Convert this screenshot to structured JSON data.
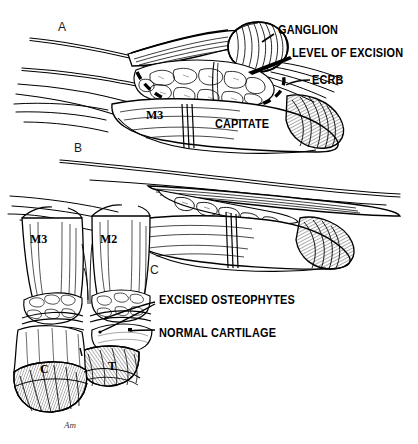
{
  "figure": {
    "background_color": "#ffffff",
    "ink_color": "#000000",
    "width": 418,
    "height": 444
  },
  "panels": [
    {
      "id": "A",
      "marker": "A",
      "caption": "Exposure of dorsal ganglion with level of excision outlined"
    },
    {
      "id": "B",
      "marker": "B",
      "caption": "Wrist after excision of ganglion and dorsal capsule"
    },
    {
      "id": "C",
      "marker": "C",
      "caption": "Carpometacarpal joints after osteophyte excision"
    }
  ],
  "labels": {
    "ganglion": "GANGLION",
    "level_of_excision": "LEVEL OF EXCISION",
    "ecrb": "ECRB",
    "capitate": "CAPITATE",
    "m3_a": "M3",
    "m3_c": "M3",
    "m2_c": "M2",
    "excised_osteophytes": "EXCISED OSTEOPHYTES",
    "normal_cartilage": "NORMAL  CARTILAGE",
    "capitate_short": "C",
    "trapezoid_short": "T"
  },
  "panel_markers": {
    "a": "A",
    "b": "B",
    "c": "C"
  },
  "signature": {
    "text": "Am",
    "kind": "artist-signature"
  }
}
